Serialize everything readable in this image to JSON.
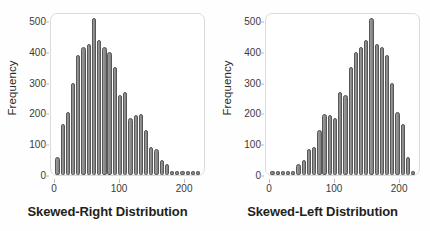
{
  "figure": {
    "background_color": "#fefefe",
    "bar_fill_color": "#8d8d8d",
    "bar_edge_color": "#575757",
    "frame_color": "#dcdcdc",
    "text_color": "#231f20"
  },
  "chart_data": [
    {
      "type": "bar",
      "title": "Skewed-Right Distribution",
      "xlabel": "",
      "ylabel": "Frequency",
      "ylim": [
        0,
        530
      ],
      "xlim": [
        -6,
        232
      ],
      "grid": false,
      "legend": null,
      "ytick_labels": [
        "0",
        "100",
        "200",
        "300",
        "400",
        "500"
      ],
      "ytick_values": [
        0,
        100,
        200,
        300,
        400,
        500
      ],
      "xtick_labels": [
        "0",
        "100",
        "200"
      ],
      "xtick_values": [
        0,
        100,
        200
      ],
      "bin_width": 8,
      "x": [
        4,
        12,
        20,
        28,
        36,
        44,
        52,
        60,
        68,
        76,
        84,
        92,
        100,
        108,
        116,
        124,
        132,
        140,
        148,
        156,
        164,
        172,
        180,
        188,
        196,
        204,
        212,
        220
      ],
      "values": [
        60,
        165,
        205,
        300,
        390,
        415,
        425,
        510,
        440,
        415,
        400,
        350,
        260,
        270,
        185,
        195,
        200,
        145,
        90,
        85,
        50,
        35,
        12,
        12,
        12,
        12,
        12,
        12
      ]
    },
    {
      "type": "bar",
      "title": "Skewed-Left Distribution",
      "xlabel": "",
      "ylabel": "Frequency",
      "ylim": [
        0,
        530
      ],
      "xlim": [
        -6,
        232
      ],
      "grid": false,
      "legend": null,
      "ytick_labels": [
        "0",
        "100",
        "200",
        "300",
        "400",
        "500"
      ],
      "ytick_values": [
        0,
        100,
        200,
        300,
        400,
        500
      ],
      "xtick_labels": [
        "0",
        "100",
        "200"
      ],
      "xtick_values": [
        0,
        100,
        200
      ],
      "bin_width": 8,
      "x": [
        4,
        12,
        20,
        28,
        36,
        44,
        52,
        60,
        68,
        76,
        84,
        92,
        100,
        108,
        116,
        124,
        132,
        140,
        148,
        156,
        164,
        172,
        180,
        188,
        196,
        204,
        212,
        220
      ],
      "values": [
        12,
        12,
        12,
        12,
        12,
        35,
        50,
        85,
        90,
        145,
        200,
        195,
        185,
        270,
        260,
        350,
        400,
        415,
        440,
        510,
        425,
        415,
        390,
        300,
        205,
        165,
        60,
        12
      ]
    }
  ]
}
